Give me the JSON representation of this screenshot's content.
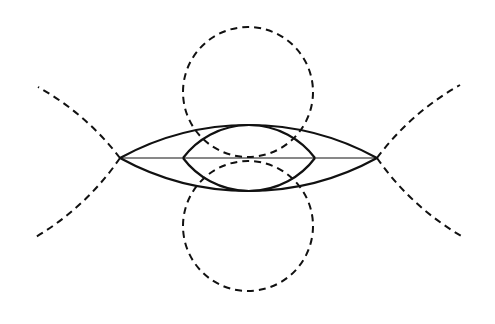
{
  "diagram": {
    "stroke_color": "#111111",
    "background": "#ffffff",
    "elements": [
      {
        "id": "top-circle",
        "type": "circle",
        "style": "dashed",
        "cx": 248,
        "cy": 92,
        "r": 65
      },
      {
        "id": "bottom-circle",
        "type": "circle",
        "style": "dashed",
        "cx": 248,
        "cy": 226,
        "r": 65
      },
      {
        "id": "outer-lens",
        "type": "lens",
        "style": "solid",
        "vertices": [
          [
            120,
            158
          ],
          [
            377,
            158
          ]
        ],
        "top_y": 125,
        "bottom_y": 192
      },
      {
        "id": "inner-lens",
        "type": "lens",
        "style": "solid",
        "vertices": [
          [
            183,
            158
          ],
          [
            315,
            158
          ]
        ],
        "top_y": 125,
        "bottom_y": 192
      },
      {
        "id": "chord",
        "type": "line",
        "style": "thin",
        "from": [
          120,
          158
        ],
        "to": [
          377,
          158
        ]
      },
      {
        "id": "outer-arc-extensions",
        "type": "arcs",
        "style": "dashed",
        "endpoints": [
          [
            39,
            87
          ],
          [
            34,
            240
          ],
          [
            460,
            84
          ],
          [
            463,
            236
          ]
        ]
      }
    ]
  }
}
